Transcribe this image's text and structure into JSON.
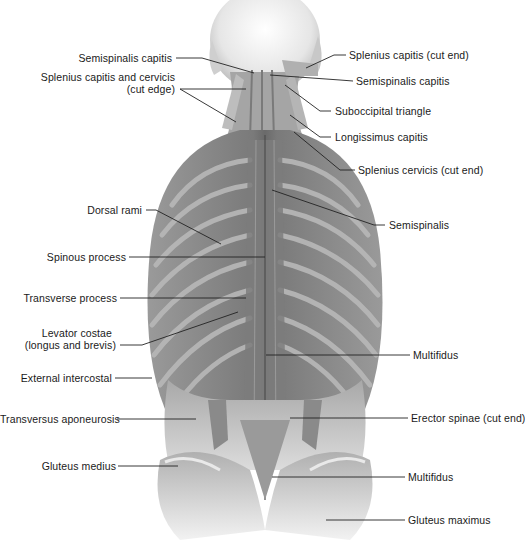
{
  "figure": {
    "colors": {
      "background": "#ffffff",
      "muscle_dark": "#6e6e6e",
      "muscle_mid": "#8f8f8f",
      "muscle_light": "#c4c4c4",
      "rib_highlight": "#b8b8b8",
      "skin": "#e3e3e3",
      "leader_line": "#222222",
      "text": "#1a1a1a"
    }
  },
  "labels_left": [
    {
      "id": "semispinalis-capitis-left",
      "text": "Semispinalis capitis"
    },
    {
      "id": "splenius-capitis-cervicis-cut-edge",
      "text": "Splenius capitis and cervicis",
      "text2": "(cut edge)"
    },
    {
      "id": "dorsal-rami",
      "text": "Dorsal rami"
    },
    {
      "id": "spinous-process",
      "text": "Spinous process"
    },
    {
      "id": "transverse-process",
      "text": "Transverse process"
    },
    {
      "id": "levator-costae",
      "text": "Levator costae",
      "text2": "(longus and brevis)"
    },
    {
      "id": "external-intercostal",
      "text": "External intercostal"
    },
    {
      "id": "transversus-aponeurosis",
      "text": "Transversus aponeurosis"
    },
    {
      "id": "gluteus-medius",
      "text": "Gluteus medius"
    }
  ],
  "labels_right": [
    {
      "id": "splenius-capitis-cut-end",
      "text": "Splenius capitis (cut end)"
    },
    {
      "id": "semispinalis-capitis-right",
      "text": "Semispinalis capitis"
    },
    {
      "id": "suboccipital-triangle",
      "text": "Suboccipital triangle"
    },
    {
      "id": "longissimus-capitis",
      "text": "Longissimus capitis"
    },
    {
      "id": "splenius-cervicis-cut-end",
      "text": "Splenius cervicis (cut end)"
    },
    {
      "id": "semispinalis",
      "text": "Semispinalis"
    },
    {
      "id": "multifidus-upper",
      "text": "Multifidus"
    },
    {
      "id": "erector-spinae-cut-end",
      "text": "Erector spinae (cut end)"
    },
    {
      "id": "multifidus-lower",
      "text": "Multifidus"
    },
    {
      "id": "gluteus-maximus",
      "text": "Gluteus maximus"
    }
  ]
}
